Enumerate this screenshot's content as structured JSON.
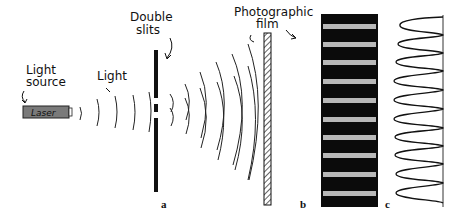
{
  "diagram": {
    "labels": {
      "light_source_line1": "Light",
      "light_source_line2": "source",
      "light": "Light",
      "double_slits_line1": "Double",
      "double_slits_line2": "slits",
      "photographic_film_line1": "Photographic",
      "film_line2": "film",
      "laser": "Laser"
    },
    "panels": {
      "a": "a",
      "b": "b",
      "c": "c"
    },
    "fringe_count": 10,
    "colors": {
      "ink": "#111111",
      "laser_fill": "#7a7a7a",
      "film_pattern_bg": "#0b0b0b",
      "bright_band": "#b8b8b8"
    }
  }
}
